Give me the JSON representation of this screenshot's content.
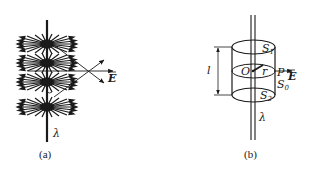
{
  "figure_a": {
    "caption": "(a)",
    "line_charge_label": "λ",
    "field_label": "E",
    "field_bursts": 4
  },
  "figure_b": {
    "caption": "(b)",
    "line_charge_label": "λ",
    "top_surface_label": "S",
    "top_surface_sub": "1",
    "bottom_surface_label": "S",
    "bottom_surface_sub": "2",
    "side_surface_label": "S",
    "side_surface_sub": "0",
    "center_label": "O",
    "radius_label": "r",
    "point_label": "P",
    "field_label": "E",
    "length_label": "l"
  },
  "colors": {
    "ink": "#1a1a1a",
    "background": "#ffffff"
  }
}
